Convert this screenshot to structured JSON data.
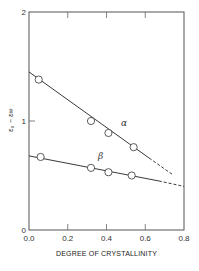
{
  "chart_data": {
    "type": "line",
    "title": "",
    "xlabel": "DEGREE OF CRYSTALLINITY",
    "ylabel": "ε₀ − ε∞",
    "xlim": [
      0.0,
      0.8
    ],
    "ylim": [
      0,
      2
    ],
    "x_ticks": [
      "0.0",
      "0.2",
      "0.4",
      "0.6",
      "0.8"
    ],
    "x_tick_values": [
      0.0,
      0.2,
      0.4,
      0.6,
      0.8
    ],
    "y_ticks": [
      "0",
      "1",
      "2"
    ],
    "y_tick_values": [
      0,
      1,
      2
    ],
    "grid": false,
    "legend": "inline labels",
    "series": [
      {
        "name": "α",
        "label_position": [
          0.49,
          0.95
        ],
        "points": {
          "x": [
            0.05,
            0.32,
            0.41,
            0.54
          ],
          "y": [
            1.38,
            1.0,
            0.89,
            0.76
          ]
        },
        "fit_line": {
          "solid": [
            [
              0.0,
              1.45
            ],
            [
              0.62,
              0.66
            ]
          ],
          "dashed": [
            [
              0.62,
              0.66
            ],
            [
              0.74,
              0.51
            ]
          ]
        }
      },
      {
        "name": "β",
        "label_position": [
          0.37,
          0.65
        ],
        "points": {
          "x": [
            0.06,
            0.32,
            0.41,
            0.53
          ],
          "y": [
            0.67,
            0.57,
            0.53,
            0.5
          ]
        },
        "fit_line": {
          "solid": [
            [
              0.0,
              0.68
            ],
            [
              0.67,
              0.45
            ]
          ],
          "dashed": [
            [
              0.67,
              0.45
            ],
            [
              0.8,
              0.4
            ]
          ]
        }
      }
    ]
  }
}
